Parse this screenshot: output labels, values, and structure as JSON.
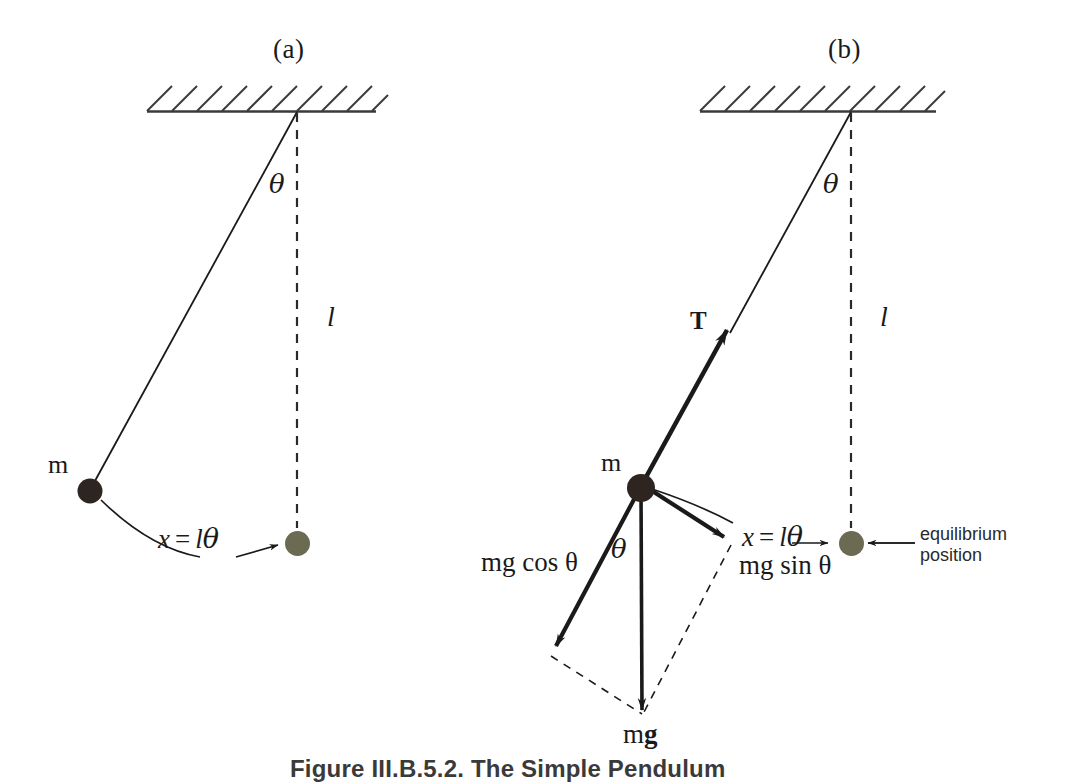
{
  "figure": {
    "caption": "Figure III.B.5.2.  The Simple Pendulum",
    "colors": {
      "ink": "#1a1a1a",
      "bob_displaced": "#2e2420",
      "bob_equilibrium": "#6b6a52",
      "hatch": "#3a3a3a",
      "dashed": "#2a2a2a"
    }
  },
  "panels": [
    {
      "id": "a",
      "title": "(a)",
      "labels": {
        "mass": "m",
        "angle": "θ",
        "length": "l",
        "arc_formula_x": "x",
        "arc_formula_eq": "=",
        "arc_formula_l": "l",
        "arc_formula_theta": "θ"
      }
    },
    {
      "id": "b",
      "title": "(b)",
      "labels": {
        "mass": "m",
        "angle_top": "θ",
        "angle_bob": "θ",
        "length": "l",
        "tension": "T",
        "weight": "mg",
        "weight_m": "m",
        "weight_g": "g",
        "component_cos": "mg cos θ",
        "component_sin": "mg sin θ",
        "arc_formula_x": "x",
        "arc_formula_eq": "=",
        "arc_formula_l": "l",
        "arc_formula_theta": "θ",
        "equilibrium_note": "equilibrium\nposition"
      }
    }
  ]
}
